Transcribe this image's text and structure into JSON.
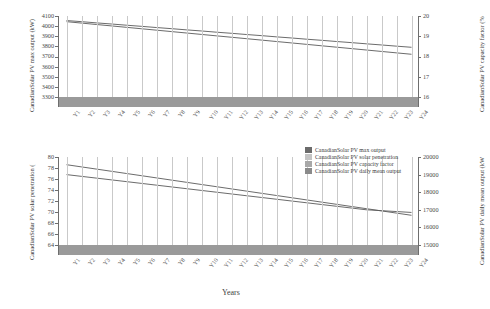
{
  "chart_data": {
    "type": "line",
    "title": "",
    "xlabel": "Years",
    "categories": [
      "Y1",
      "Y2",
      "Y3",
      "Y4",
      "Y5",
      "Y6",
      "Y7",
      "Y8",
      "Y9",
      "Y10",
      "Y11",
      "Y12",
      "Y13",
      "Y14",
      "Y15",
      "Y16",
      "Y17",
      "Y18",
      "Y19",
      "Y20",
      "Y21",
      "Y22",
      "Y23",
      "Y24"
    ],
    "panels": [
      {
        "name": "top",
        "ylabel_left": "CanadianSolar PV max output (kW)",
        "ylabel_right": "CanadianSolar PV capacity factor (%",
        "ylim_left": [
          3300,
          4100
        ],
        "ylim_right": [
          16,
          20
        ],
        "yticks_left": [
          "4100",
          "4000",
          "3900",
          "3800",
          "3700",
          "3600",
          "3500",
          "3400",
          "3300"
        ],
        "yticks_right": [
          "20",
          "19",
          "18",
          "17",
          "16"
        ],
        "grid": true,
        "series": [
          {
            "name": "CanadianSolar PV max output",
            "axis": "left",
            "values": [
              4055,
              4044,
              4032,
              4021,
              4009,
              3998,
              3986,
              3975,
              3963,
              3952,
              3940,
              3929,
              3917,
              3906,
              3894,
              3883,
              3871,
              3860,
              3848,
              3837,
              3825,
              3814,
              3802,
              3791
            ]
          },
          {
            "name": "CanadianSolar PV capacity factor",
            "axis": "right",
            "values": [
              19.72,
              19.65,
              19.58,
              19.51,
              19.44,
              19.37,
              19.3,
              19.23,
              19.16,
              19.09,
              19.02,
              18.95,
              18.88,
              18.81,
              18.74,
              18.67,
              18.6,
              18.53,
              18.46,
              18.39,
              18.32,
              18.25,
              18.18,
              18.11
            ]
          }
        ],
        "band": {
          "label": "baseline band",
          "color": "#9a9a9a",
          "from": 3300,
          "to": 3345
        }
      },
      {
        "name": "bottom",
        "ylabel_left": "CanadianSolar PV solar penetration (",
        "ylabel_right": "CanadianSolar PV daily mean output (kW",
        "ylim_left": [
          64,
          80
        ],
        "ylim_right": [
          15000,
          20000
        ],
        "yticks_left": [
          "80",
          "78",
          "76",
          "74",
          "72",
          "70",
          "68",
          "66",
          "64"
        ],
        "yticks_right": [
          "20000",
          "19000",
          "18000",
          "17000",
          "16000",
          "15000"
        ],
        "grid": true,
        "series": [
          {
            "name": "CanadianSolar PV solar penetration",
            "axis": "left",
            "values": [
              78.6,
              78.2,
              77.8,
              77.4,
              77.0,
              76.6,
              76.2,
              75.8,
              75.4,
              75.0,
              74.6,
              74.2,
              73.8,
              73.4,
              73.0,
              72.6,
              72.2,
              71.8,
              71.4,
              71.0,
              70.6,
              70.2,
              69.8,
              69.4
            ]
          },
          {
            "name": "CanadianSolar PV daily mean output",
            "axis": "right",
            "values": [
              19000,
              18900,
              18800,
              18700,
              18600,
              18500,
              18400,
              18300,
              18200,
              18100,
              18000,
              17900,
              17800,
              17700,
              17600,
              17500,
              17400,
              17300,
              17200,
              17100,
              17000,
              16950,
              16900,
              16850
            ]
          }
        ],
        "band": {
          "label": "baseline band",
          "color": "#9a9a9a",
          "from": 64.0,
          "to": 64.9
        }
      }
    ],
    "legend": {
      "position": "center",
      "entries": [
        {
          "label": "CanadianSolar PV max output",
          "color": "#6b6b6b"
        },
        {
          "label": "CanadianSolar PV solar penetration",
          "color": "#c4c4c4"
        },
        {
          "label": "CanadianSolar PV capacity factor",
          "color": "#a8a8a8"
        },
        {
          "label": "CanadianSolar PV daily mean output",
          "color": "#8a8a8a"
        }
      ]
    },
    "colors": {
      "line": "#5a5a5a",
      "grid": "#c9c9c9",
      "band": "#9a9a9a",
      "axis": "#6e6e6e",
      "text": "#3a3a3a"
    }
  }
}
